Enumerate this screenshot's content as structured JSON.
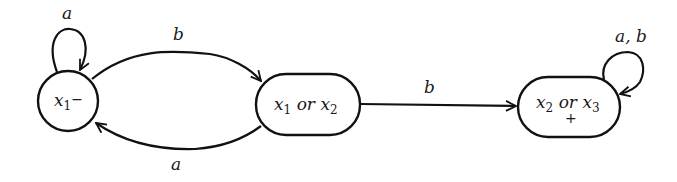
{
  "diagram": {
    "type": "finite-automaton",
    "states": [
      {
        "id": "s1",
        "var": "x",
        "sub": "1",
        "rest": "",
        "var2": "",
        "sub2": "",
        "mark": "−",
        "initial": true,
        "final": false,
        "shape": "circle"
      },
      {
        "id": "s2",
        "var": "x",
        "sub": "1",
        "rest": " or ",
        "var2": "x",
        "sub2": "2",
        "mark": "",
        "initial": false,
        "final": false,
        "shape": "pill"
      },
      {
        "id": "s3",
        "var": "x",
        "sub": "2",
        "rest": " or ",
        "var2": "x",
        "sub2": "3",
        "mark": "+",
        "initial": false,
        "final": true,
        "shape": "pill"
      }
    ],
    "transitions": [
      {
        "from": "s1",
        "to": "s1",
        "label": "a"
      },
      {
        "from": "s1",
        "to": "s2",
        "label": "b"
      },
      {
        "from": "s2",
        "to": "s1",
        "label": "a"
      },
      {
        "from": "s2",
        "to": "s3",
        "label": "b"
      },
      {
        "from": "s3",
        "to": "s3",
        "label": "a, b"
      }
    ]
  }
}
